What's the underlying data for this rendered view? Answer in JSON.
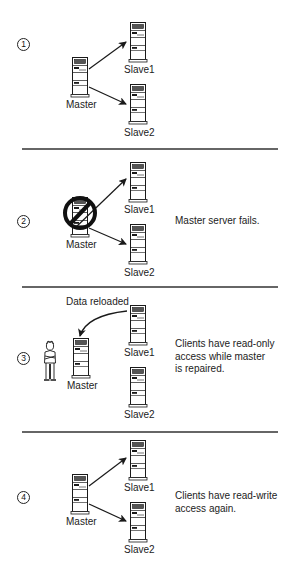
{
  "diagram": {
    "type": "master-slave failover sequence",
    "colors": {
      "ink": "#1a1a1a",
      "background": "#ffffff",
      "divider": "#333333"
    },
    "panels": [
      {
        "step": "1",
        "description": "",
        "nodes": {
          "master": "Master",
          "slave1": "Slave1",
          "slave2": "Slave2"
        },
        "arrows": [
          "Master -> Slave1",
          "Master -> Slave2"
        ]
      },
      {
        "step": "2",
        "description": "Master server fails.",
        "nodes": {
          "master": "Master",
          "slave1": "Slave1",
          "slave2": "Slave2"
        },
        "arrows": [
          "Master -> Slave1",
          "Master -> Slave2"
        ],
        "overlay": "prohibited-icon on Master"
      },
      {
        "step": "3",
        "annotation": "Data reloaded",
        "description": "Clients have read-only access while master is repaired.",
        "description_lines": [
          "Clients have read-only",
          "access while master",
          "is repaired."
        ],
        "nodes": {
          "master": "Master",
          "slave1": "Slave1",
          "slave2": "Slave2"
        },
        "arrows": [
          "Slave1 -> Master (curved)"
        ],
        "actor": "technician"
      },
      {
        "step": "4",
        "description": "Clients have read-write access again.",
        "description_lines": [
          "Clients have read-write",
          "access again."
        ],
        "nodes": {
          "master": "Master",
          "slave1": "Slave1",
          "slave2": "Slave2"
        },
        "arrows": [
          "Master -> Slave1",
          "Master -> Slave2"
        ]
      }
    ]
  }
}
